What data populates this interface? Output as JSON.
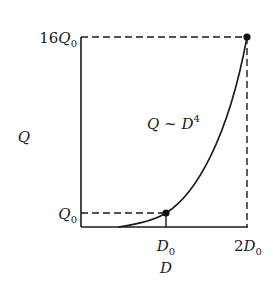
{
  "diagram": {
    "type": "graph",
    "y_axis_label": "Q",
    "x_axis_label": "D",
    "y_ticks": [
      {
        "coef": "16",
        "symbol": "Q",
        "sub": "0"
      },
      {
        "coef": "",
        "symbol": "Q",
        "sub": "0"
      }
    ],
    "x_ticks": [
      {
        "coef": "",
        "symbol": "D",
        "sub": "0"
      },
      {
        "coef": "2",
        "symbol": "D",
        "sub": "0"
      }
    ],
    "curve_label": {
      "lhs": "Q",
      "rel": " ~ ",
      "base": "D",
      "exp": "4"
    },
    "points": [
      {
        "x": "D0",
        "y": "Q0"
      },
      {
        "x": "2D0",
        "y": "16Q0"
      }
    ],
    "colors": {
      "ink": "#1a1a1a",
      "background": "#ffffff"
    }
  }
}
